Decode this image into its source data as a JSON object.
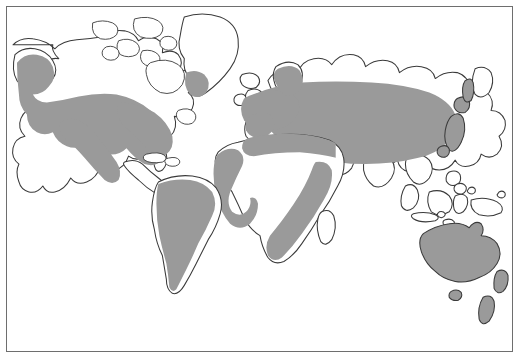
{
  "figure": {
    "type": "world-distribution-map",
    "projection": "cylindrical",
    "frame_border_color": "#6e6e6e",
    "ocean_color": "#ffffff",
    "coastline_color": "#3a3a3a",
    "shaded_region_color": "#9a9a9a",
    "unshaded_land_color": "#ffffff",
    "title": "",
    "caption": "",
    "legend": []
  },
  "map_data": {
    "type": "choropleth-binary",
    "description": "World map with certain land areas filled solid gray to indicate a distribution range; remaining land areas are left white with dark outlines.",
    "categories": [
      {
        "key": "shaded",
        "label": "",
        "color": "#9a9a9a"
      },
      {
        "key": "unshaded",
        "label": "",
        "color": "#ffffff"
      }
    ],
    "regions_shaded": [
      "Alaska and western North America",
      "Most of the contiguous United States",
      "Southern and eastern Canada",
      "Southern tip of Greenland",
      "Europe including Scandinavia and British Isles",
      "European Russia and Siberia",
      "Central Asia",
      "Northern China and Mongolia",
      "Japan",
      "North Africa coastal strip",
      "West Africa coastal band",
      "Southeastern and southern Africa",
      "Most of South America",
      "Australia",
      "New Zealand"
    ],
    "regions_unshaded": [
      "Arctic Canadian archipelago",
      "Most of Greenland",
      "Iceland",
      "Sahara interior",
      "Central Africa and Congo basin",
      "Horn of Africa",
      "Madagascar",
      "Arabian Peninsula",
      "Indian subcontinent",
      "Southeast Asia and Indochina",
      "Indonesia and Philippines",
      "New Guinea",
      "Central America and the Caribbean",
      "Antarctica (not depicted)"
    ]
  }
}
